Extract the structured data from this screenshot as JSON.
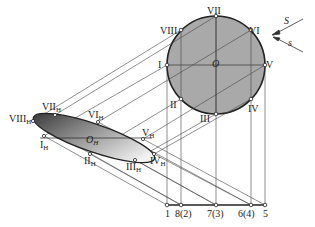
{
  "diagram": {
    "circle": {
      "center_label": "O",
      "points": [
        {
          "label": "I",
          "pos": "left"
        },
        {
          "label": "II",
          "pos": "lower-left"
        },
        {
          "label": "III",
          "pos": "bottom"
        },
        {
          "label": "IV",
          "pos": "lower-right"
        },
        {
          "label": "V",
          "pos": "right"
        },
        {
          "label": "VI",
          "pos": "upper-right"
        },
        {
          "label": "VII",
          "pos": "top"
        },
        {
          "label": "VIII",
          "pos": "upper-left"
        }
      ],
      "fill": "#a9a9a9"
    },
    "ellipse": {
      "center_label": "O",
      "center_sub": "H",
      "points": [
        {
          "label": "I",
          "sub": "H"
        },
        {
          "label": "II",
          "sub": "H"
        },
        {
          "label": "III",
          "sub": "H"
        },
        {
          "label": "IV",
          "sub": "H"
        },
        {
          "label": "V",
          "sub": "H"
        },
        {
          "label": "VI",
          "sub": "H"
        },
        {
          "label": "VII",
          "sub": "H"
        },
        {
          "label": "VIII",
          "sub": "H"
        }
      ],
      "fill_dark": "#3a3a3a",
      "fill_light": "#f0f0f0"
    },
    "direction": {
      "S_label": "S",
      "s_label": "s"
    },
    "baseline": {
      "labels": [
        "1",
        "8(2)",
        "7(3)",
        "6(4)",
        "5"
      ]
    }
  }
}
